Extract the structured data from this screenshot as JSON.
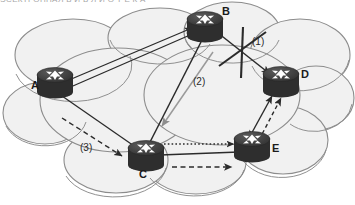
{
  "figure": {
    "title_strip": "ЭСЕКТРОННАЯ  Б  И  Б  Л  И  О  Т  Е  К  А",
    "type": "network-topology-diagram",
    "background": "#ffffff",
    "cloud_fill": "#f1f1f1",
    "cloud_stroke": "#8c8c8c",
    "router_body": "#3a3a3a",
    "router_top": "#4e4e4e",
    "router_icon_color": "#ffffff",
    "link_color": "#2b2b2b",
    "light_link_color": "#9a9a9a"
  },
  "nodes": [
    {
      "id": "A",
      "label": "A",
      "x": 55,
      "y": 84,
      "label_x": 33,
      "label_y": 85
    },
    {
      "id": "B",
      "label": "B",
      "x": 205,
      "y": 28,
      "label_x": 222,
      "label_y": 12
    },
    {
      "id": "C",
      "label": "C",
      "x": 146,
      "y": 157,
      "label_x": 140,
      "label_y": 175
    },
    {
      "id": "D",
      "label": "D",
      "x": 281,
      "y": 83,
      "label_x": 301,
      "label_y": 74
    },
    {
      "id": "E",
      "label": "E",
      "x": 252,
      "y": 148,
      "label_x": 272,
      "label_y": 148
    }
  ],
  "links": [
    {
      "from": "A",
      "to": "B",
      "style": "double-solid",
      "arrow": "to-B",
      "note": "A to B primary path"
    },
    {
      "from": "A",
      "to": "C",
      "style": "solid",
      "arrow": "none",
      "note": "A to C link"
    },
    {
      "from": "B",
      "to": "C",
      "style": "solid",
      "arrow": "none",
      "note": "B to C link"
    },
    {
      "from": "B",
      "to": "D",
      "style": "solid",
      "arrow": "to-D",
      "note": "B to D link - failed"
    },
    {
      "from": "C",
      "to": "E",
      "style": "solid",
      "arrow": "none",
      "note": "C to E link"
    },
    {
      "from": "E",
      "to": "D",
      "style": "solid",
      "arrow": "both",
      "note": "E to D link"
    },
    {
      "from": "B",
      "to": "C",
      "style": "light-solid",
      "arrow": "to-C",
      "note": "light arrow labelled (2)"
    },
    {
      "from": "A",
      "to": "C",
      "style": "dashed",
      "arrow": "to-C",
      "note": "dashed arrow labelled (3)"
    },
    {
      "from": "C",
      "to": "E",
      "style": "dotted",
      "arrow": "to-E",
      "note": "dotted arrow above C-E link"
    },
    {
      "from": "C",
      "to": "E",
      "style": "dashed",
      "arrow": "to-E",
      "note": "dashed arrow below C-E link"
    },
    {
      "from": "E",
      "to": "D",
      "style": "dashed",
      "arrow": "to-D",
      "note": "dashed arrow E to D"
    }
  ],
  "annotations": [
    {
      "id": "n1",
      "text": "(1)",
      "x": 253,
      "y": 42,
      "refers_to": "B-D failed link"
    },
    {
      "id": "n2",
      "text": "(2)",
      "x": 194,
      "y": 82,
      "refers_to": "B-C reroute"
    },
    {
      "id": "n3",
      "text": "(3)",
      "x": 82,
      "y": 148,
      "refers_to": "A-C reroute"
    }
  ],
  "failure_mark": {
    "symbol": "cross-out",
    "x": 243,
    "y": 51,
    "marks_link": "B-D"
  }
}
